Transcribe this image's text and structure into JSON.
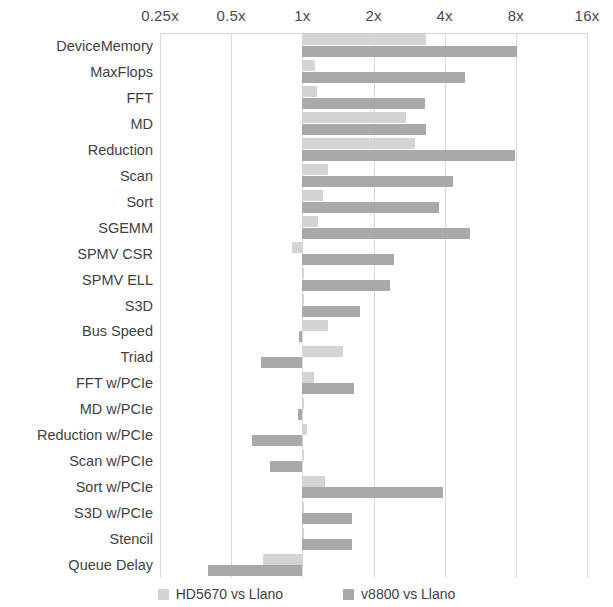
{
  "chart_data": {
    "type": "bar",
    "orientation": "horizontal",
    "title": "",
    "xlabel": "",
    "ylabel": "",
    "xscale": "log2",
    "xlim": [
      0.25,
      16
    ],
    "tick_labels": [
      "0.25x",
      "0.5x",
      "1x",
      "2x",
      "4x",
      "8x",
      "16x"
    ],
    "tick_values": [
      0.25,
      0.5,
      1,
      2,
      4,
      8,
      16
    ],
    "grid": true,
    "legend_position": "bottom",
    "categories": [
      "DeviceMemory",
      "MaxFlops",
      "FFT",
      "MD",
      "Reduction",
      "Scan",
      "Sort",
      "SGEMM",
      "SPMV CSR",
      "SPMV ELL",
      "S3D",
      "Bus Speed",
      "Triad",
      "FFT w/PCIe",
      "MD w/PCIe",
      "Reduction w/PCIe",
      "Scan w/PCIe",
      "Sort w/PCIe",
      "S3D w/PCIe",
      "Stencil",
      "Queue Delay"
    ],
    "series": [
      {
        "name": "HD5670 vs Llano",
        "color": "#d4d4d4",
        "values": [
          3.35,
          1.13,
          1.15,
          2.75,
          3.0,
          1.28,
          1.22,
          1.16,
          0.9,
          1.0,
          1.0,
          1.29,
          1.48,
          1.12,
          1.0,
          1.05,
          1.0,
          1.25,
          1.0,
          1.0,
          0.68
        ]
      },
      {
        "name": "v8800 vs Llano",
        "color": "#a9a9a9",
        "values": [
          8.1,
          4.9,
          3.3,
          3.35,
          7.9,
          4.35,
          3.8,
          5.1,
          2.45,
          2.35,
          1.76,
          0.97,
          0.67,
          1.66,
          0.96,
          0.61,
          0.73,
          3.95,
          1.62,
          1.62,
          0.4
        ]
      }
    ]
  },
  "axis": {
    "ticks": [
      {
        "label": "0.25x",
        "value": 0.25
      },
      {
        "label": "0.5x",
        "value": 0.5
      },
      {
        "label": "1x",
        "value": 1
      },
      {
        "label": "2x",
        "value": 2
      },
      {
        "label": "4x",
        "value": 4
      },
      {
        "label": "8x",
        "value": 8
      },
      {
        "label": "16x",
        "value": 16
      }
    ]
  },
  "legend": {
    "items": [
      {
        "label": "HD5670 vs Llano",
        "color": "#d4d4d4"
      },
      {
        "label": "v8800 vs Llano",
        "color": "#a9a9a9"
      }
    ]
  }
}
